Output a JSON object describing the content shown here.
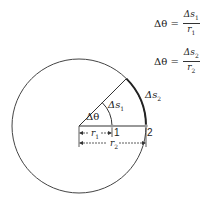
{
  "equations": [
    {
      "lhs": "Δθ =",
      "num": "Δs",
      "num_sub": "1",
      "den": "r",
      "den_sub": "1"
    },
    {
      "lhs": "Δθ =",
      "num": "Δs",
      "num_sub": "2",
      "den": "r",
      "den_sub": "2"
    }
  ],
  "labels": {
    "angle": "Δθ",
    "arc1": "Δs",
    "arc1_sub": "1",
    "arc2": "Δs",
    "arc2_sub": "2",
    "r1": "r",
    "r1_sub": "1",
    "r2": "r",
    "r2_sub": "2",
    "point1": "1",
    "point2": "2"
  },
  "colors": {
    "stroke": "#333333",
    "point": "#999999"
  }
}
